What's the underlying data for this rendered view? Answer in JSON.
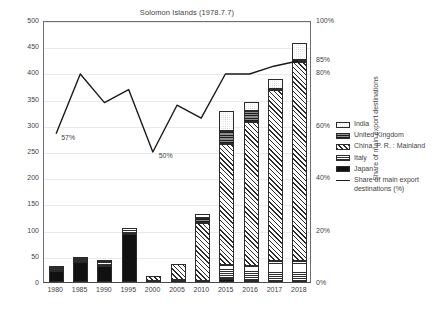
{
  "chart_data": {
    "type": "bar",
    "title": "Solomon Islands (1978.7.7)",
    "subtitle": "",
    "xlabel": "",
    "ylabel": "Million of US$",
    "ylabel_right": "Share of main export destinations",
    "categories": [
      "1980",
      "1985",
      "1990",
      "1995",
      "2000",
      "2005",
      "2010",
      "2015",
      "2016",
      "2017",
      "2018"
    ],
    "ylim": [
      0,
      500
    ],
    "yticks": [
      0,
      50,
      100,
      150,
      200,
      250,
      300,
      350,
      400,
      450,
      500
    ],
    "ylim_right": [
      0,
      100
    ],
    "yticks_right": [
      "0%",
      "20%",
      "40%",
      "60%",
      "80%",
      "100%"
    ],
    "grid": true,
    "legend_position": "right",
    "stacked": true,
    "series": [
      {
        "name": "Japan",
        "pattern": "solid-black",
        "values": [
          21,
          38,
          30,
          92,
          0,
          4,
          2,
          5,
          1,
          0,
          0
        ]
      },
      {
        "name": "Italy",
        "pattern": "horizontal-lines",
        "values": [
          5,
          5,
          8,
          11,
          2,
          0,
          0,
          28,
          30,
          40,
          41
        ]
      },
      {
        "name": "China, P. R. : Mainland",
        "pattern": "diagonal-hatch",
        "values": [
          0,
          0,
          0,
          0,
          10,
          31,
          110,
          231,
          275,
          326,
          379
        ]
      },
      {
        "name": "United Kingdom",
        "pattern": "dark-horizontal",
        "values": [
          2,
          2,
          2,
          0,
          0,
          0,
          10,
          25,
          20,
          3,
          4
        ]
      },
      {
        "name": "India",
        "pattern": "dotted-white",
        "values": [
          0,
          0,
          0,
          0,
          0,
          0,
          7,
          37,
          18,
          19,
          33
        ]
      }
    ],
    "line_series": {
      "name": "Share of main export destinations (%)",
      "values": [
        57,
        80,
        69,
        74,
        50,
        68,
        63,
        80,
        80,
        83,
        85
      ],
      "axis": "right",
      "unit": "%"
    },
    "annotations": [
      {
        "text": "57%",
        "category": "1980",
        "value": 57
      },
      {
        "text": "50%",
        "category": "2000",
        "value": 50
      },
      {
        "text": "85%",
        "category": "2018",
        "value": 85
      }
    ]
  },
  "axis_left": {
    "label": "Million of US$",
    "ticks": [
      "500",
      "450",
      "400",
      "350",
      "300",
      "250",
      "200",
      "150",
      "100",
      "50",
      "0"
    ]
  },
  "axis_right": {
    "label": "Share of main export destinations",
    "ticks": [
      "100%",
      "85%",
      "80%",
      "60%",
      "40%",
      "20%",
      "0%"
    ]
  },
  "axis_bottom": {
    "ticks": [
      "1980",
      "1985",
      "1990",
      "1995",
      "2000",
      "2005",
      "2010",
      "2015",
      "2016",
      "2017",
      "2018"
    ]
  },
  "legend": {
    "items": [
      {
        "label": "India"
      },
      {
        "label": "United Kingdom"
      },
      {
        "label": "China, P. R. : Mainland"
      },
      {
        "label": "Italy"
      },
      {
        "label": "Japan"
      },
      {
        "label": "Share of main export destinations (%)"
      }
    ]
  },
  "annotations": {
    "first": "57%",
    "min": "50%",
    "last": "85%"
  }
}
